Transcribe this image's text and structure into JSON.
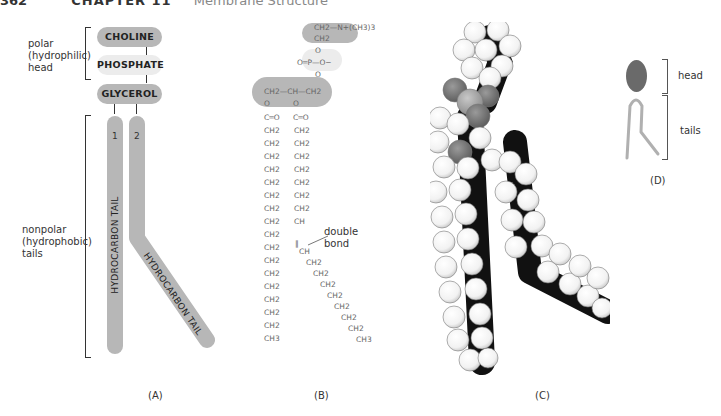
{
  "header": {
    "page_number": "362",
    "chapter": "CHAPTER 11",
    "title": "Membrane Structure"
  },
  "panel_a": {
    "caption": "(A)",
    "head_label": [
      "polar",
      "(hydrophilic)",
      "head"
    ],
    "tail_label": [
      "nonpolar",
      "(hydrophobic)",
      "tails"
    ],
    "groups": [
      "CHOLINE",
      "PHOSPHATE",
      "GLYCEROL"
    ],
    "tail_numbers": [
      "1",
      "2"
    ],
    "tail_text": "HYDROCARBON TAIL"
  },
  "panel_b": {
    "caption": "(B)",
    "choline": [
      "CH2—N+(CH3)3",
      "CH2"
    ],
    "phosphate": "O═P—O−",
    "glycerol": "CH2—CH—CH2",
    "carbonyl": "C═O",
    "tail1_units": [
      "CH2",
      "CH2",
      "CH2",
      "CH2",
      "CH2",
      "CH2",
      "CH2",
      "CH2",
      "CH2",
      "CH2",
      "CH2",
      "CH2",
      "CH2",
      "CH2",
      "CH2",
      "CH2",
      "CH3"
    ],
    "tail2_units_straight": [
      "CH2",
      "CH2",
      "CH2",
      "CH2",
      "CH2",
      "CH2",
      "CH2",
      "CH"
    ],
    "tail2_units_kinked": [
      "CH",
      "CH2",
      "CH2",
      "CH2",
      "CH2",
      "CH2",
      "CH2",
      "CH2",
      "CH3"
    ],
    "double_bond_label": [
      "double",
      "bond"
    ]
  },
  "panel_c": {
    "caption": "(C)",
    "description": "space-filling model of phosphatidylcholine"
  },
  "panel_d": {
    "caption": "(D)",
    "head_label": "head",
    "tails_label": "tails"
  },
  "colors": {
    "dark_pill": "#b7b7b7",
    "light_pill": "#ececec",
    "head_oval": "#6a6a6a",
    "tail_line": "#b0b0b0",
    "oxygen": "#7d7d7d",
    "phosphorus": "#a8a8a8"
  }
}
